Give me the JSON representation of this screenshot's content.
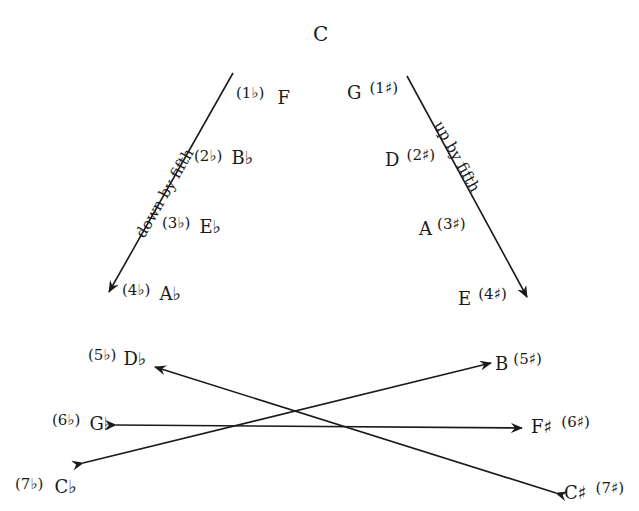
{
  "title": "",
  "center": {
    "note": "C"
  },
  "flat_side": {
    "axis_label": "down by fifth",
    "items": [
      {
        "key": "(1♭)",
        "note": "F"
      },
      {
        "key": "(2♭)",
        "note": "B♭"
      },
      {
        "key": "(3♭)",
        "note": "E♭"
      },
      {
        "key": "(4♭)",
        "note": "A♭"
      },
      {
        "key": "(5♭)",
        "note": "D♭"
      },
      {
        "key": "(6♭)",
        "note": "G♭"
      },
      {
        "key": "(7♭)",
        "note": "C♭"
      }
    ]
  },
  "sharp_side": {
    "axis_label": "up by fifth",
    "items": [
      {
        "key": "(1♯)",
        "note": "G"
      },
      {
        "key": "(2♯)",
        "note": "D"
      },
      {
        "key": "(3♯)",
        "note": "A"
      },
      {
        "key": "(4♯)",
        "note": "E"
      },
      {
        "key": "(5♯)",
        "note": "B"
      },
      {
        "key": "(6♯)",
        "note": "F♯"
      },
      {
        "key": "(7♯)",
        "note": "C♯"
      }
    ]
  },
  "enharmonic_pairs": [
    {
      "from": "C♯",
      "to": "D♭"
    },
    {
      "from": "G♭",
      "to": "F♯",
      "bidirectional": true
    },
    {
      "from": "C♭",
      "to": "B"
    }
  ],
  "colors": {
    "ink": "#1a1a1a",
    "background": "#ffffff"
  }
}
